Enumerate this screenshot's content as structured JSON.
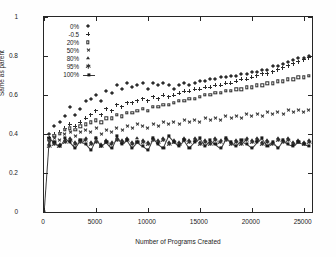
{
  "chart_data": {
    "type": "scatter",
    "title": "",
    "xlabel": "Number of Programs Created",
    "ylabel": "Same as parent",
    "xlim": [
      0,
      25800
    ],
    "ylim": [
      0,
      1
    ],
    "grid": false,
    "legend_position": "upper-left-inside",
    "x_ticks": [
      "0",
      "5000",
      "10000",
      "15000",
      "20000",
      "25000"
    ],
    "x_tick_values": [
      0,
      5000,
      10000,
      15000,
      20000,
      25000
    ],
    "y_ticks": [
      "0",
      "0.2",
      "0.4",
      "0.6",
      "0.8",
      "1"
    ],
    "y_tick_values": [
      0,
      0.2,
      0.4,
      0.6,
      0.8,
      1
    ],
    "series": [
      {
        "name": "0%",
        "marker": "diamond",
        "line": false,
        "x": [
          500,
          1000,
          1500,
          2000,
          2500,
          3000,
          3500,
          4000,
          4500,
          5000,
          5500,
          6000,
          6500,
          7000,
          7500,
          8000,
          8500,
          9000,
          9500,
          10000,
          10500,
          11000,
          11500,
          12000,
          12500,
          13000,
          13500,
          14000,
          14500,
          15000,
          15500,
          16000,
          16500,
          17000,
          17500,
          18000,
          18500,
          19000,
          19500,
          20000,
          20500,
          21000,
          21500,
          22000,
          22500,
          23000,
          23500,
          24000,
          24500,
          25000,
          25500
        ],
        "y": [
          0.4,
          0.44,
          0.46,
          0.49,
          0.54,
          0.5,
          0.53,
          0.57,
          0.58,
          0.6,
          0.57,
          0.62,
          0.61,
          0.65,
          0.63,
          0.66,
          0.64,
          0.65,
          0.66,
          0.63,
          0.66,
          0.65,
          0.66,
          0.65,
          0.63,
          0.65,
          0.66,
          0.65,
          0.66,
          0.67,
          0.67,
          0.68,
          0.68,
          0.69,
          0.69,
          0.7,
          0.7,
          0.71,
          0.71,
          0.72,
          0.72,
          0.73,
          0.73,
          0.75,
          0.75,
          0.76,
          0.77,
          0.78,
          0.79,
          0.79,
          0.8
        ]
      },
      {
        "name": "-0.5",
        "marker": "plus",
        "line": false,
        "x": [
          500,
          1000,
          1500,
          2000,
          2500,
          3000,
          3500,
          4000,
          4500,
          5000,
          5500,
          6000,
          6500,
          7000,
          7500,
          8000,
          8500,
          9000,
          9500,
          10000,
          10500,
          11000,
          11500,
          12000,
          12500,
          13000,
          13500,
          14000,
          14500,
          15000,
          15500,
          16000,
          16500,
          17000,
          17500,
          18000,
          18500,
          19000,
          19500,
          20000,
          20500,
          21000,
          21500,
          22000,
          22500,
          23000,
          23500,
          24000,
          24500,
          25000,
          25500
        ],
        "y": [
          0.38,
          0.4,
          0.41,
          0.43,
          0.45,
          0.44,
          0.46,
          0.48,
          0.5,
          0.52,
          0.5,
          0.53,
          0.52,
          0.55,
          0.54,
          0.56,
          0.56,
          0.57,
          0.58,
          0.57,
          0.59,
          0.58,
          0.6,
          0.59,
          0.6,
          0.61,
          0.62,
          0.62,
          0.63,
          0.63,
          0.64,
          0.64,
          0.65,
          0.65,
          0.66,
          0.66,
          0.67,
          0.68,
          0.68,
          0.69,
          0.7,
          0.71,
          0.71,
          0.72,
          0.73,
          0.74,
          0.75,
          0.76,
          0.77,
          0.78,
          0.79
        ]
      },
      {
        "name": "20%",
        "marker": "open-square",
        "line": false,
        "x": [
          500,
          1000,
          1500,
          2000,
          2500,
          3000,
          3500,
          4000,
          4500,
          5000,
          5500,
          6000,
          6500,
          7000,
          7500,
          8000,
          8500,
          9000,
          9500,
          10000,
          10500,
          11000,
          11500,
          12000,
          12500,
          13000,
          13500,
          14000,
          14500,
          15000,
          15500,
          16000,
          16500,
          17000,
          17500,
          18000,
          18500,
          19000,
          19500,
          20000,
          20500,
          21000,
          21500,
          22000,
          22500,
          23000,
          23500,
          24000,
          24500,
          25000,
          25500
        ],
        "y": [
          0.37,
          0.39,
          0.4,
          0.42,
          0.43,
          0.42,
          0.44,
          0.45,
          0.46,
          0.47,
          0.46,
          0.48,
          0.48,
          0.5,
          0.49,
          0.51,
          0.51,
          0.52,
          0.53,
          0.52,
          0.54,
          0.54,
          0.55,
          0.55,
          0.56,
          0.57,
          0.57,
          0.58,
          0.58,
          0.59,
          0.6,
          0.6,
          0.61,
          0.61,
          0.62,
          0.62,
          0.63,
          0.63,
          0.64,
          0.64,
          0.65,
          0.65,
          0.66,
          0.66,
          0.67,
          0.67,
          0.68,
          0.68,
          0.69,
          0.69,
          0.7
        ]
      },
      {
        "name": "50%",
        "marker": "x",
        "line": false,
        "x": [
          500,
          1000,
          1500,
          2000,
          2500,
          3000,
          3500,
          4000,
          4500,
          5000,
          5500,
          6000,
          6500,
          7000,
          7500,
          8000,
          8500,
          9000,
          9500,
          10000,
          10500,
          11000,
          11500,
          12000,
          12500,
          13000,
          13500,
          14000,
          14500,
          15000,
          15500,
          16000,
          16500,
          17000,
          17500,
          18000,
          18500,
          19000,
          19500,
          20000,
          20500,
          21000,
          21500,
          22000,
          22500,
          23000,
          23500,
          24000,
          24500,
          25000,
          25500
        ],
        "y": [
          0.36,
          0.38,
          0.37,
          0.4,
          0.41,
          0.39,
          0.41,
          0.42,
          0.41,
          0.43,
          0.4,
          0.42,
          0.41,
          0.43,
          0.42,
          0.44,
          0.43,
          0.45,
          0.44,
          0.43,
          0.45,
          0.44,
          0.46,
          0.45,
          0.46,
          0.45,
          0.47,
          0.46,
          0.47,
          0.46,
          0.48,
          0.47,
          0.48,
          0.47,
          0.49,
          0.48,
          0.49,
          0.48,
          0.5,
          0.49,
          0.5,
          0.49,
          0.51,
          0.5,
          0.51,
          0.5,
          0.52,
          0.51,
          0.52,
          0.51,
          0.52
        ]
      },
      {
        "name": "80%",
        "marker": "triangle",
        "line": false,
        "x": [
          500,
          1000,
          1500,
          2000,
          2500,
          3000,
          3500,
          4000,
          4500,
          5000,
          5500,
          6000,
          6500,
          7000,
          7500,
          8000,
          8500,
          9000,
          9500,
          10000,
          10500,
          11000,
          11500,
          12000,
          12500,
          13000,
          13500,
          14000,
          14500,
          15000,
          15500,
          16000,
          16500,
          17000,
          17500,
          18000,
          18500,
          19000,
          19500,
          20000,
          20500,
          21000,
          21500,
          22000,
          22500,
          23000,
          23500,
          24000,
          24500,
          25000,
          25500
        ],
        "y": [
          0.35,
          0.36,
          0.35,
          0.37,
          0.38,
          0.36,
          0.37,
          0.38,
          0.36,
          0.38,
          0.35,
          0.37,
          0.36,
          0.38,
          0.37,
          0.38,
          0.36,
          0.38,
          0.37,
          0.36,
          0.38,
          0.37,
          0.38,
          0.36,
          0.37,
          0.36,
          0.38,
          0.37,
          0.38,
          0.36,
          0.37,
          0.36,
          0.38,
          0.37,
          0.38,
          0.36,
          0.37,
          0.36,
          0.38,
          0.37,
          0.38,
          0.36,
          0.37,
          0.36,
          0.38,
          0.37,
          0.38,
          0.36,
          0.37,
          0.36,
          0.37
        ]
      },
      {
        "name": "95%",
        "marker": "star",
        "line": false,
        "x": [
          500,
          1000,
          1500,
          2000,
          2500,
          3000,
          3500,
          4000,
          4500,
          5000,
          5500,
          6000,
          6500,
          7000,
          7500,
          8000,
          8500,
          9000,
          9500,
          10000,
          10500,
          11000,
          11500,
          12000,
          12500,
          13000,
          13500,
          14000,
          14500,
          15000,
          15500,
          16000,
          16500,
          17000,
          17500,
          18000,
          18500,
          19000,
          19500,
          20000,
          20500,
          21000,
          21500,
          22000,
          22500,
          23000,
          23500,
          24000,
          24500,
          25000,
          25500
        ],
        "y": [
          0.34,
          0.35,
          0.34,
          0.36,
          0.37,
          0.35,
          0.36,
          0.37,
          0.35,
          0.36,
          0.34,
          0.36,
          0.35,
          0.37,
          0.36,
          0.37,
          0.35,
          0.36,
          0.36,
          0.35,
          0.37,
          0.36,
          0.37,
          0.35,
          0.36,
          0.35,
          0.37,
          0.36,
          0.37,
          0.35,
          0.36,
          0.35,
          0.37,
          0.36,
          0.37,
          0.35,
          0.36,
          0.35,
          0.37,
          0.36,
          0.37,
          0.35,
          0.36,
          0.35,
          0.37,
          0.36,
          0.37,
          0.35,
          0.36,
          0.35,
          0.36
        ]
      },
      {
        "name": "100%",
        "marker": "filled-square",
        "line": true,
        "x": [
          0,
          500,
          1000,
          1500,
          2000,
          2500,
          3000,
          3500,
          4000,
          4500,
          5000,
          5500,
          6000,
          6500,
          7000,
          7500,
          8000,
          8500,
          9000,
          9500,
          10000,
          10500,
          11000,
          11500,
          12000,
          12500,
          13000,
          13500,
          14000,
          14500,
          15000,
          15500,
          16000,
          16500,
          17000,
          17500,
          18000,
          18500,
          19000,
          19500,
          20000,
          20500,
          21000,
          21500,
          22000,
          22500,
          23000,
          23500,
          24000,
          24500,
          25000,
          25500
        ],
        "y": [
          0.0,
          0.38,
          0.36,
          0.34,
          0.38,
          0.36,
          0.33,
          0.37,
          0.35,
          0.32,
          0.38,
          0.34,
          0.36,
          0.33,
          0.39,
          0.35,
          0.37,
          0.33,
          0.36,
          0.34,
          0.32,
          0.38,
          0.35,
          0.33,
          0.39,
          0.36,
          0.34,
          0.37,
          0.33,
          0.36,
          0.38,
          0.34,
          0.37,
          0.35,
          0.33,
          0.38,
          0.36,
          0.34,
          0.37,
          0.35,
          0.33,
          0.36,
          0.38,
          0.34,
          0.36,
          0.33,
          0.37,
          0.35,
          0.34,
          0.36,
          0.35,
          0.34
        ]
      }
    ]
  },
  "legend": {
    "items": [
      {
        "label": "0%",
        "marker": "diamond"
      },
      {
        "label": "-0.5",
        "marker": "plus"
      },
      {
        "label": "20%",
        "marker": "open-square"
      },
      {
        "label": "50%",
        "marker": "x"
      },
      {
        "label": "80%",
        "marker": "triangle"
      },
      {
        "label": "95%",
        "marker": "star"
      },
      {
        "label": "100%",
        "marker": "filled-square-line"
      }
    ]
  },
  "colors": {
    "axis": "#262626",
    "marker": "#2b2b2b",
    "background": "#ffffff"
  }
}
